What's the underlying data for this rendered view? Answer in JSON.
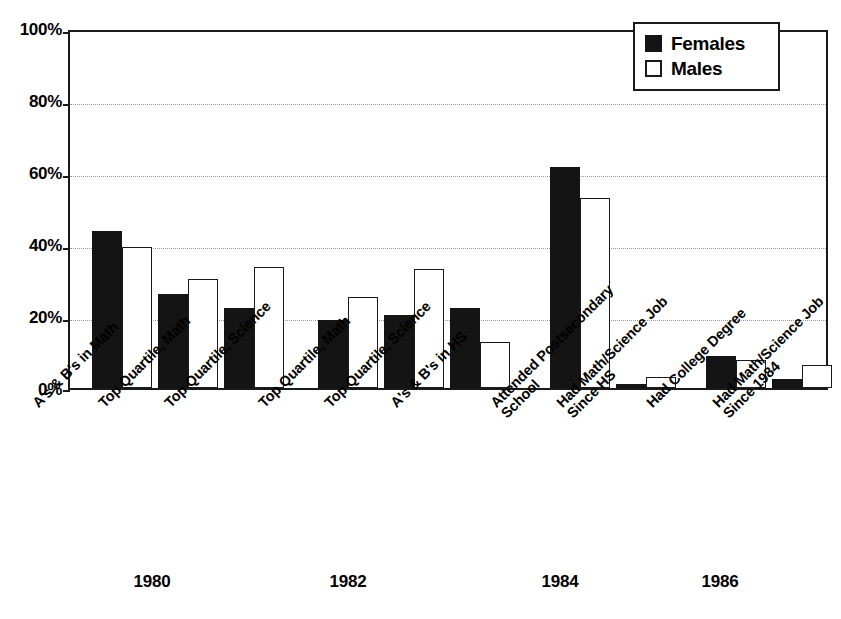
{
  "chart_data": {
    "type": "bar",
    "title": "",
    "subtitle": "",
    "xlabel": "",
    "ylabel": "",
    "ylim": [
      0,
      100
    ],
    "y_ticks": [
      "0%",
      "20%",
      "40%",
      "60%",
      "80%",
      "100%"
    ],
    "y_tick_values": [
      0,
      20,
      40,
      60,
      80,
      100
    ],
    "grid": "horizontal-dotted",
    "legend_position": "top-right",
    "legend": [
      "Females",
      "Males"
    ],
    "categories": [
      "A's & B's in Math",
      "Top Quartile, Math",
      "Top Quartile, Science",
      "Top Quartile, Math",
      "Top Quartile, Science",
      "A's & B's in HS",
      "Attended Postsecondary School",
      "Had Math/Science Job Since HS",
      "Had College Degree",
      "Had Math/Science Job Since 1984"
    ],
    "series": [
      {
        "name": "Females",
        "color": "#141414",
        "values": [
          44,
          26.5,
          22.5,
          19,
          20.5,
          22.5,
          62,
          1,
          9,
          2.5
        ]
      },
      {
        "name": "Males",
        "color": "#ffffff",
        "values": [
          39.5,
          30.5,
          34,
          25.5,
          33.5,
          13,
          53.5,
          3,
          8,
          6.5
        ]
      }
    ],
    "group_labels": [
      "1980",
      "1982",
      "1984",
      "1986"
    ],
    "groups": [
      {
        "year": "1980",
        "category_indices": [
          0,
          1,
          2
        ]
      },
      {
        "year": "1982",
        "category_indices": [
          3,
          4,
          5
        ]
      },
      {
        "year": "1984",
        "category_indices": [
          6,
          7
        ]
      },
      {
        "year": "1986",
        "category_indices": [
          8,
          9
        ]
      }
    ]
  },
  "axis": {
    "y_labels": [
      "100%",
      "80%",
      "60%",
      "40%",
      "20%",
      "0%"
    ]
  },
  "legend": {
    "items": [
      {
        "label": "Females",
        "swatch": "filled-black"
      },
      {
        "label": "Males",
        "swatch": "outlined-white"
      }
    ]
  },
  "category_labels": [
    {
      "line1": "A's & B's in Math",
      "line2": ""
    },
    {
      "line1": "Top Quartile, Math",
      "line2": ""
    },
    {
      "line1": "Top Quartile, Science",
      "line2": ""
    },
    {
      "line1": "Top Quartile, Math",
      "line2": ""
    },
    {
      "line1": "Top Quartile, Science",
      "line2": ""
    },
    {
      "line1": "A's & B's in HS",
      "line2": ""
    },
    {
      "line1": "Attended Postsecondary",
      "line2": "School"
    },
    {
      "line1": "Had Math/Science Job",
      "line2": "Since HS"
    },
    {
      "line1": "Had College Degree",
      "line2": ""
    },
    {
      "line1": "Had Math/Science Job",
      "line2": "Since 1984"
    }
  ],
  "year_labels": [
    {
      "text": "1980"
    },
    {
      "text": "1982"
    },
    {
      "text": "1984"
    },
    {
      "text": "1986"
    }
  ]
}
